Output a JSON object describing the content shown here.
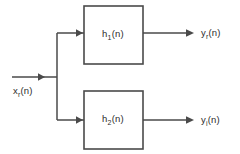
{
  "diagram": {
    "type": "block-diagram",
    "blocks": [
      {
        "id": "h1",
        "label_main": "h",
        "label_sub": "1",
        "label_tail": "(n)",
        "label_full": "h₁(n)"
      },
      {
        "id": "h2",
        "label_main": "h",
        "label_sub": "2",
        "label_tail": "(n)",
        "label_full": "h₂(n)"
      }
    ],
    "input": {
      "id": "xr",
      "label_main": "x",
      "label_sub": "r",
      "label_tail": "(n)",
      "label_full": "xᵣ(n)"
    },
    "outputs": [
      {
        "id": "yr",
        "label_main": "y",
        "label_sub": "r",
        "label_tail": "(n)",
        "label_full": "yᵣ(n)"
      },
      {
        "id": "yi",
        "label_main": "y",
        "label_sub": "i",
        "label_tail": "(n)",
        "label_full": "yᵢ(n)"
      }
    ],
    "colors": {
      "stroke": "#4a4a4a",
      "text": "#2d2d2d",
      "background": "#ffffff",
      "block_fill": "#ffffff"
    }
  }
}
